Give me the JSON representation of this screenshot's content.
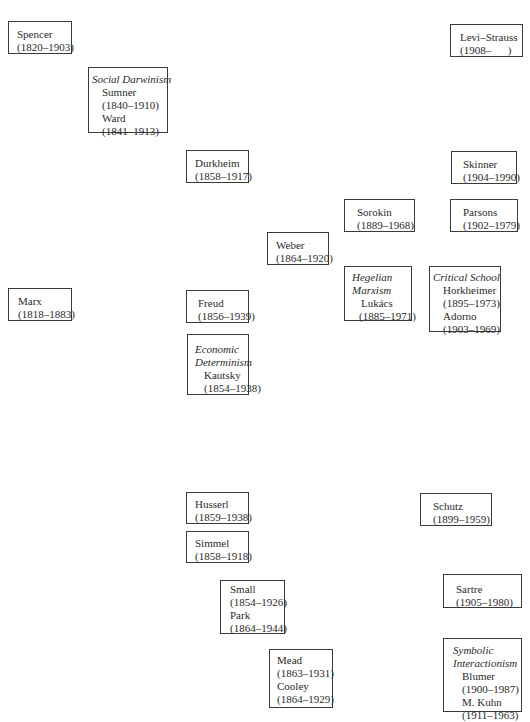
{
  "nodes": [
    {
      "id": "spencer",
      "name": "Spencer",
      "years": "(1820–1903)"
    },
    {
      "id": "social-darwinism",
      "label": "Social Darwinism",
      "members": [
        {
          "name": "Sumner",
          "years": "(1840–1910)"
        },
        {
          "name": "Ward",
          "years": "(1841–1913)"
        }
      ]
    },
    {
      "id": "levi-strauss",
      "name": "Levi–Strauss",
      "years": "(1908–      )"
    },
    {
      "id": "durkheim",
      "name": "Durkheim",
      "years": "(1858–1917)"
    },
    {
      "id": "skinner",
      "name": "Skinner",
      "years": "(1904–1990)"
    },
    {
      "id": "sorokin",
      "name": "Sorokin",
      "years": "(1889–1968)"
    },
    {
      "id": "parsons",
      "name": "Parsons",
      "years": "(1902–1979)"
    },
    {
      "id": "weber",
      "name": "Weber",
      "years": "(1864–1920)"
    },
    {
      "id": "marx",
      "name": "Marx",
      "years": "(1818–1883)"
    },
    {
      "id": "freud",
      "name": "Freud",
      "years": "(1856–1939)"
    },
    {
      "id": "hegelian-marxism",
      "label_lines": [
        "Hegelian",
        "Marxism"
      ],
      "members": [
        {
          "name": "Lukács",
          "years": "(1885–1971)"
        }
      ]
    },
    {
      "id": "critical-school",
      "label": "Critical School",
      "members": [
        {
          "name": "Horkheimer",
          "years": "(1895–1973)"
        },
        {
          "name": "Adorno",
          "years": "(1903–1969)"
        }
      ]
    },
    {
      "id": "economic-determinism",
      "label_lines": [
        "Economic",
        "Determinism"
      ],
      "members": [
        {
          "name": "Kautsky",
          "years": "(1854–1938)"
        }
      ]
    },
    {
      "id": "husserl",
      "name": "Husserl",
      "years": "(1859–1938)"
    },
    {
      "id": "simmel",
      "name": "Simmel",
      "years": "(1858–1918)"
    },
    {
      "id": "schutz",
      "name": "Schutz",
      "years": "(1899–1959)"
    },
    {
      "id": "small-park",
      "members": [
        {
          "name": "Small",
          "years": "(1854–1926)"
        },
        {
          "name": "Park",
          "years": "(1864–1944)"
        }
      ]
    },
    {
      "id": "sartre",
      "name": "Sartre",
      "years": "(1905–1980)"
    },
    {
      "id": "mead-cooley",
      "members": [
        {
          "name": "Mead",
          "years": "(1863–1931)"
        },
        {
          "name": "Cooley",
          "years": "(1864–1929)"
        }
      ]
    },
    {
      "id": "symbolic-interactionism",
      "label_lines": [
        "Symbolic",
        "Interactionism"
      ],
      "members": [
        {
          "name": "Blumer",
          "years": "(1900–1987)"
        },
        {
          "name": "M. Kuhn",
          "years": "(1911–1963)"
        }
      ]
    }
  ]
}
